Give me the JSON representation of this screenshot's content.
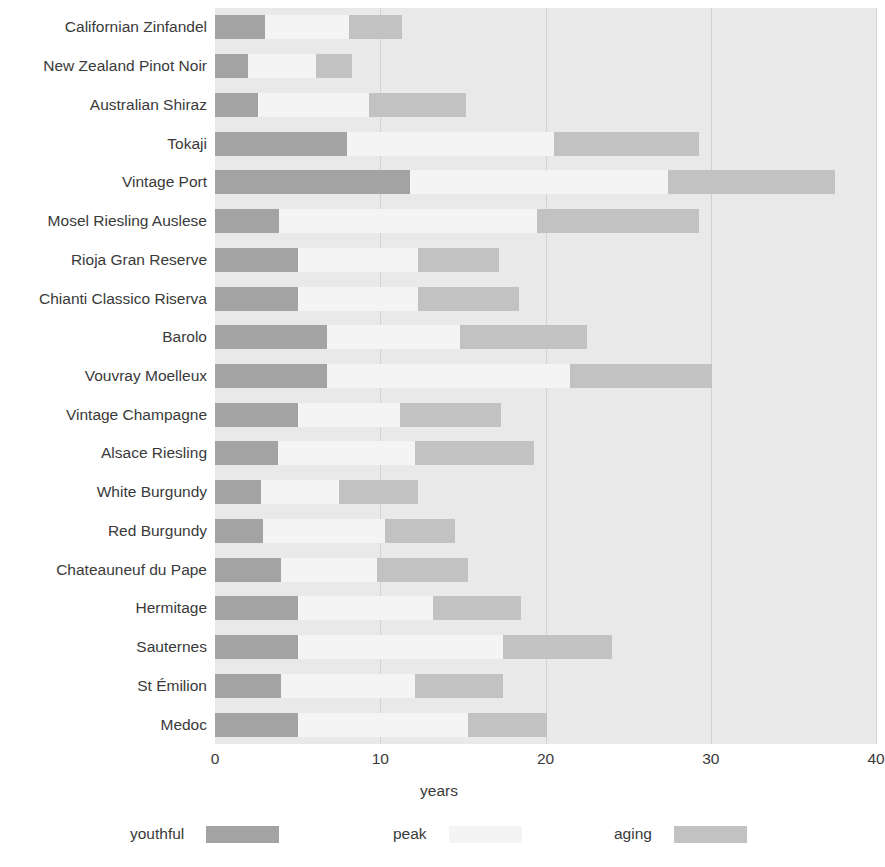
{
  "chart_data": {
    "type": "bar",
    "subtype": "stacked-horizontal-range",
    "title": "",
    "xlabel": "years",
    "ylabel": "",
    "xlim": [
      0,
      40
    ],
    "xticks": [
      0,
      10,
      20,
      30,
      40
    ],
    "xtick_labels": [
      "0",
      "10",
      "20",
      "30",
      "40"
    ],
    "grid": true,
    "grid_axis": "x",
    "legend_position": "bottom",
    "series": [
      {
        "name": "youthful",
        "color": "#a3a3a3"
      },
      {
        "name": "peak",
        "color": "#f4f4f4"
      },
      {
        "name": "aging",
        "color": "#c2c2c2"
      }
    ],
    "categories": [
      "Californian Zinfandel",
      "New Zealand Pinot Noir",
      "Australian Shiraz",
      "Tokaji",
      "Vintage Port",
      "Mosel Riesling Auslese",
      "Rioja Gran Reserve",
      "Chianti Classico Riserva",
      "Barolo",
      "Vouvray Moelleux",
      "Vintage Champagne",
      "Alsace Riesling",
      "White Burgundy",
      "Red Burgundy",
      "Chateauneuf du Pape",
      "Hermitage",
      "Sauternes",
      "St Émilion",
      "Medoc"
    ],
    "rows": [
      {
        "label": "Californian Zinfandel",
        "youthful_start": 0,
        "youthful_end": 3.0,
        "peak_start": 3.0,
        "peak_end": 8.1,
        "aging_start": 8.1,
        "aging_end": 11.3
      },
      {
        "label": "New Zealand Pinot Noir",
        "youthful_start": 0,
        "youthful_end": 2.0,
        "peak_start": 2.0,
        "peak_end": 6.1,
        "aging_start": 6.1,
        "aging_end": 8.3
      },
      {
        "label": "Australian Shiraz",
        "youthful_start": 0,
        "youthful_end": 2.6,
        "peak_start": 2.6,
        "peak_end": 9.3,
        "aging_start": 9.3,
        "aging_end": 15.2
      },
      {
        "label": "Tokaji",
        "youthful_start": 0,
        "youthful_end": 8.0,
        "peak_start": 8.0,
        "peak_end": 20.5,
        "aging_start": 20.5,
        "aging_end": 29.3
      },
      {
        "label": "Vintage Port",
        "youthful_start": 0,
        "youthful_end": 11.8,
        "peak_start": 11.8,
        "peak_end": 27.4,
        "aging_start": 27.4,
        "aging_end": 37.5
      },
      {
        "label": "Mosel Riesling Auslese",
        "youthful_start": 0,
        "youthful_end": 3.9,
        "peak_start": 3.9,
        "peak_end": 19.5,
        "aging_start": 19.5,
        "aging_end": 29.3
      },
      {
        "label": "Rioja Gran Reserve",
        "youthful_start": 0,
        "youthful_end": 5.0,
        "peak_start": 5.0,
        "peak_end": 12.3,
        "aging_start": 12.3,
        "aging_end": 17.2
      },
      {
        "label": "Chianti Classico Riserva",
        "youthful_start": 0,
        "youthful_end": 5.0,
        "peak_start": 5.0,
        "peak_end": 12.3,
        "aging_start": 12.3,
        "aging_end": 18.4
      },
      {
        "label": "Barolo",
        "youthful_start": 0,
        "youthful_end": 6.8,
        "peak_start": 6.8,
        "peak_end": 14.8,
        "aging_start": 14.8,
        "aging_end": 22.5
      },
      {
        "label": "Vouvray Moelleux",
        "youthful_start": 0,
        "youthful_end": 6.8,
        "peak_start": 6.8,
        "peak_end": 21.5,
        "aging_start": 21.5,
        "aging_end": 30.1
      },
      {
        "label": "Vintage Champagne",
        "youthful_start": 0,
        "youthful_end": 5.0,
        "peak_start": 5.0,
        "peak_end": 11.2,
        "aging_start": 11.2,
        "aging_end": 17.3
      },
      {
        "label": "Alsace Riesling",
        "youthful_start": 0,
        "youthful_end": 3.8,
        "peak_start": 3.8,
        "peak_end": 12.1,
        "aging_start": 12.1,
        "aging_end": 19.3
      },
      {
        "label": "White Burgundy",
        "youthful_start": 0,
        "youthful_end": 2.8,
        "peak_start": 2.8,
        "peak_end": 7.5,
        "aging_start": 7.5,
        "aging_end": 12.3
      },
      {
        "label": "Red Burgundy",
        "youthful_start": 0,
        "youthful_end": 2.9,
        "peak_start": 2.9,
        "peak_end": 10.3,
        "aging_start": 10.3,
        "aging_end": 14.5
      },
      {
        "label": "Chateauneuf du Pape",
        "youthful_start": 0,
        "youthful_end": 4.0,
        "peak_start": 4.0,
        "peak_end": 9.8,
        "aging_start": 9.8,
        "aging_end": 15.3
      },
      {
        "label": "Hermitage",
        "youthful_start": 0,
        "youthful_end": 5.0,
        "peak_start": 5.0,
        "peak_end": 13.2,
        "aging_start": 13.2,
        "aging_end": 18.5
      },
      {
        "label": "Sauternes",
        "youthful_start": 0,
        "youthful_end": 5.0,
        "peak_start": 5.0,
        "peak_end": 17.4,
        "aging_start": 17.4,
        "aging_end": 24.0
      },
      {
        "label": "St Émilion",
        "youthful_start": 0,
        "youthful_end": 4.0,
        "peak_start": 4.0,
        "peak_end": 12.1,
        "aging_start": 12.1,
        "aging_end": 17.4
      },
      {
        "label": "Medoc",
        "youthful_start": 0,
        "youthful_end": 5.0,
        "peak_start": 5.0,
        "peak_end": 15.3,
        "aging_start": 15.3,
        "aging_end": 20.1
      }
    ]
  },
  "axis": {
    "x_title": "years",
    "tick_labels": [
      "0",
      "10",
      "20",
      "30",
      "40"
    ]
  },
  "legend": {
    "items": [
      {
        "label": "youthful",
        "color": "#a3a3a3"
      },
      {
        "label": "peak",
        "color": "#f4f4f4"
      },
      {
        "label": "aging",
        "color": "#c2c2c2"
      }
    ]
  },
  "colors": {
    "plot_background": "#e9e9e9",
    "gridline": "#d2d2d2",
    "youthful": "#a3a3a3",
    "peak": "#f4f4f4",
    "aging": "#c2c2c2",
    "text": "#3a3a3a"
  }
}
